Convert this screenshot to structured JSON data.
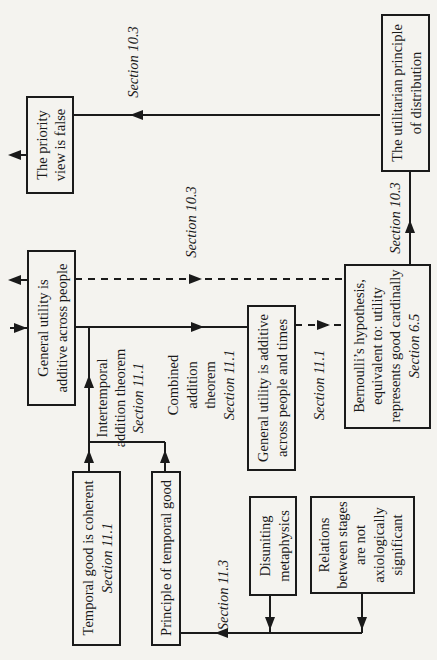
{
  "diagram": {
    "orientation": "rotated 90° counter-clockwise",
    "nodes": {
      "utilitarian": {
        "lines": [
          "The utilitarian principle",
          "of distribution"
        ]
      },
      "priority": {
        "lines": [
          "The priority",
          "view is false"
        ]
      },
      "gu_people": {
        "lines": [
          "General utility is",
          "additive across people"
        ]
      },
      "bernoulli": {
        "lines": [
          "Bernoulli’s hypothesis,",
          "equivalent to: utility",
          "represents good cardinally"
        ],
        "section": "Section 6.5"
      },
      "gu_people_times": {
        "lines": [
          "General utility is additive",
          "across people and times"
        ]
      },
      "temporal_coherent": {
        "lines": [
          "Temporal good is coherent"
        ],
        "section": "Section 11.1"
      },
      "principle_temporal": {
        "lines": [
          "Principle of temporal good"
        ]
      },
      "disuniting": {
        "lines": [
          "Disuniting",
          "metaphysics"
        ]
      },
      "relations": {
        "lines": [
          "Relations",
          "between stages",
          "are not",
          "axiologically",
          "significant"
        ]
      }
    },
    "edge_labels": {
      "util_to_priority": "Section 10.3",
      "bernoulli_to_util": "Section 10.3",
      "gu_to_bernoulli": "Section 10.3",
      "intertemporal": {
        "lines": [
          "Intertemporal",
          "addition theorem"
        ],
        "section": "Section 11.1"
      },
      "combined": {
        "lines": [
          "Combined",
          "addition",
          "theorem"
        ],
        "section": "Section 11.1"
      },
      "gupt_to_bernoulli": "Section 11.1",
      "to_principle_temporal": "Section 11.3"
    }
  }
}
